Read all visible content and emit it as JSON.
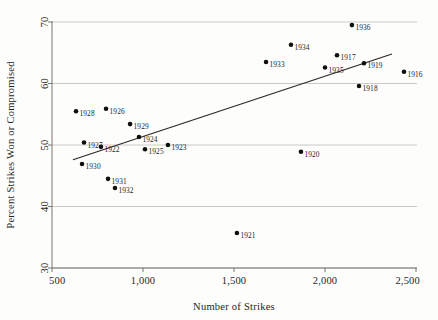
{
  "chart_data": {
    "type": "scatter",
    "title": "",
    "xlabel": "Number of Strikes",
    "ylabel": "Percent Strikes Won or Compromised",
    "xlim": [
      500,
      2500
    ],
    "ylim": [
      30,
      70
    ],
    "xticks": [
      500,
      1000,
      1500,
      2000,
      2500
    ],
    "xtick_labels": [
      "500",
      "1,000",
      "1,500",
      "2,000",
      "2,500"
    ],
    "yticks": [
      30,
      40,
      50,
      60,
      70
    ],
    "ytick_labels": [
      "30",
      "40",
      "50",
      "60",
      "70"
    ],
    "grid": "horizontal",
    "legend": "none",
    "point_color": "#110f0e",
    "line_color": "#2b2725",
    "grid_color": "#b6b2ad",
    "axis_color": "#6a6662",
    "points": [
      {
        "label": "1916",
        "x": 2434,
        "y": 61.9
      },
      {
        "label": "1917",
        "x": 2066,
        "y": 64.6
      },
      {
        "label": "1918",
        "x": 2187,
        "y": 59.6
      },
      {
        "label": "1919",
        "x": 2214,
        "y": 63.3
      },
      {
        "label": "1920",
        "x": 1868,
        "y": 48.9
      },
      {
        "label": "1921",
        "x": 1516,
        "y": 35.7
      },
      {
        "label": "1922",
        "x": 769,
        "y": 49.7
      },
      {
        "label": "1923",
        "x": 1137,
        "y": 50.0
      },
      {
        "label": "1924",
        "x": 978,
        "y": 51.3
      },
      {
        "label": "1925",
        "x": 1011,
        "y": 49.3
      },
      {
        "label": "1926",
        "x": 797,
        "y": 55.9
      },
      {
        "label": "1927",
        "x": 676,
        "y": 50.4
      },
      {
        "label": "1928",
        "x": 632,
        "y": 55.5
      },
      {
        "label": "1929",
        "x": 929,
        "y": 53.4
      },
      {
        "label": "1930",
        "x": 665,
        "y": 46.9
      },
      {
        "label": "1931",
        "x": 808,
        "y": 44.5
      },
      {
        "label": "1932",
        "x": 846,
        "y": 43.0
      },
      {
        "label": "1933",
        "x": 1676,
        "y": 63.5
      },
      {
        "label": "1934",
        "x": 1813,
        "y": 66.3
      },
      {
        "label": "1935",
        "x": 2000,
        "y": 62.6
      },
      {
        "label": "1936",
        "x": 2148,
        "y": 69.5
      }
    ],
    "trend_line": {
      "x_start": 615,
      "y_start": 47.6,
      "x_end": 2368,
      "y_end": 64.8
    }
  }
}
